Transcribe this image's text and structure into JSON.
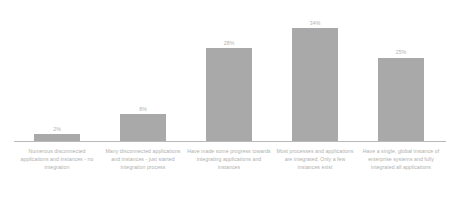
{
  "chart_data": {
    "type": "bar",
    "title": "",
    "subtitle": "",
    "xlabel": "",
    "ylabel": "",
    "ylim": [
      0,
      40
    ],
    "grid": false,
    "legend": null,
    "categories": [
      "Numerous disconnected applications and instances - no integration",
      "Many disconnected applications and instances - just started integration process",
      "Have made some progress towards integrating applications and instances",
      "Most processes and applications are integrated. Only a few instances exist",
      "Have a single, global instance of enterprise systems and fully integrated all applications"
    ],
    "values": [
      2,
      8,
      28,
      34,
      25
    ],
    "value_labels": [
      "2%",
      "8%",
      "28%",
      "34%",
      "25%"
    ],
    "colors": {
      "bar": "#a9a9a9",
      "axis": "#b9b9b9",
      "label_text": "#b0b0b0",
      "value_text": "#b4b4b4",
      "background": "#ffffff"
    }
  }
}
